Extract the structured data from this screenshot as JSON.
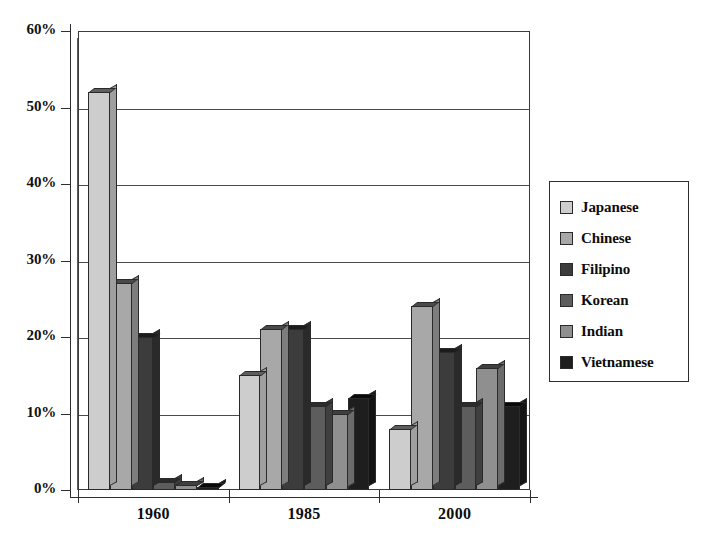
{
  "chart_data": {
    "type": "bar",
    "title": "",
    "subtitle": "",
    "xlabel": "",
    "ylabel": "",
    "categories": [
      "1960",
      "1985",
      "2000"
    ],
    "ylim": [
      0,
      60
    ],
    "ytick_values": [
      0,
      10,
      20,
      30,
      40,
      50,
      60
    ],
    "ytick_labels": [
      "0%",
      "10%",
      "20%",
      "30%",
      "40%",
      "50%",
      "60%"
    ],
    "grid": true,
    "legend_position": "right",
    "value_suffix": "%",
    "series": [
      {
        "name": "Japanese",
        "color": "#cdcdcd",
        "side_color": "#9f9f9f",
        "top_color": "#5e5e5e",
        "values": [
          52,
          15,
          8
        ]
      },
      {
        "name": "Chinese",
        "color": "#a8a8a8",
        "side_color": "#7d7d7d",
        "top_color": "#4a4a4a",
        "values": [
          27,
          21,
          24
        ]
      },
      {
        "name": "Filipino",
        "color": "#3c3c3c",
        "side_color": "#2a2a2a",
        "top_color": "#1c1c1c",
        "values": [
          20,
          21,
          18
        ]
      },
      {
        "name": "Korean",
        "color": "#5d5d5d",
        "side_color": "#3f3f3f",
        "top_color": "#2b2b2b",
        "values": [
          1,
          11,
          11
        ]
      },
      {
        "name": "Indian",
        "color": "#8f8f8f",
        "side_color": "#6b6b6b",
        "top_color": "#3f3f3f",
        "values": [
          0.6,
          10,
          16
        ]
      },
      {
        "name": "Vietnamese",
        "color": "#1e1e1e",
        "side_color": "#141414",
        "top_color": "#0a0a0a",
        "values": [
          0.4,
          12,
          11
        ]
      }
    ]
  },
  "legend": {
    "items": [
      {
        "label": "Japanese"
      },
      {
        "label": "Chinese"
      },
      {
        "label": "Filipino"
      },
      {
        "label": "Korean"
      },
      {
        "label": "Indian"
      },
      {
        "label": "Vietnamese"
      }
    ]
  }
}
